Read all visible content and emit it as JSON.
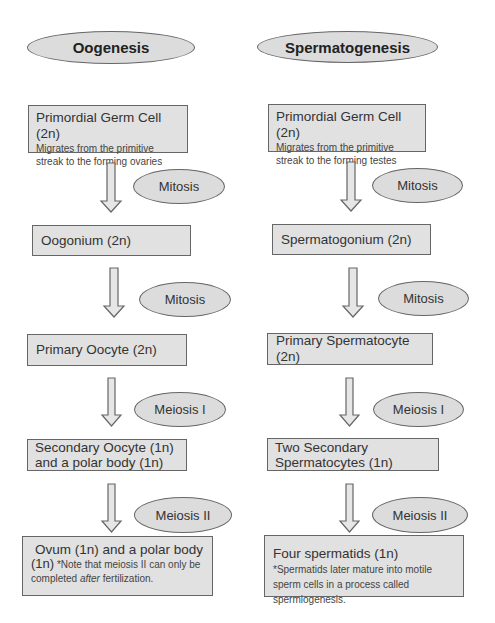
{
  "diagram": {
    "type": "flowchart",
    "columns": [
      {
        "title": "Oogenesis",
        "steps": [
          {
            "main": "Primordial Germ Cell (2n)",
            "sub": "Migrates from the primitive streak to the forming ovaries"
          },
          {
            "main": "Oogonium (2n)"
          },
          {
            "main": "Primary Oocyte (2n)"
          },
          {
            "main": "Secondary Oocyte (1n) and a polar body (1n)"
          },
          {
            "main_line1": "Ovum (1n) and a polar body",
            "main_line2": "(1n)",
            "note_pre": " *Note that meiosis II can only be completed ",
            "note_em": "after",
            "note_post": " fertilization."
          }
        ],
        "transitions": [
          "Mitosis",
          "Mitosis",
          "Meiosis I",
          "Meiosis II"
        ]
      },
      {
        "title": "Spermatogenesis",
        "steps": [
          {
            "main": "Primordial Germ Cell (2n)",
            "sub": "Migrates from the primitive streak to the forming testes"
          },
          {
            "main": "Spermatogonium (2n)"
          },
          {
            "main": "Primary Spermatocyte (2n)"
          },
          {
            "main": "Two Secondary Spermatocytes (1n)"
          },
          {
            "main": "Four spermatids (1n)",
            "note": " *Spermatids later mature into motile sperm cells in a process called spermiogenesis."
          }
        ],
        "transitions": [
          "Mitosis",
          "Mitosis",
          "Meiosis I",
          "Meiosis II"
        ]
      }
    ]
  },
  "colors": {
    "box_fill": "#e1e1e1",
    "oval_fill": "#dcdcdc",
    "border": "#666666",
    "arrow_fill": "#e6e6e6"
  }
}
